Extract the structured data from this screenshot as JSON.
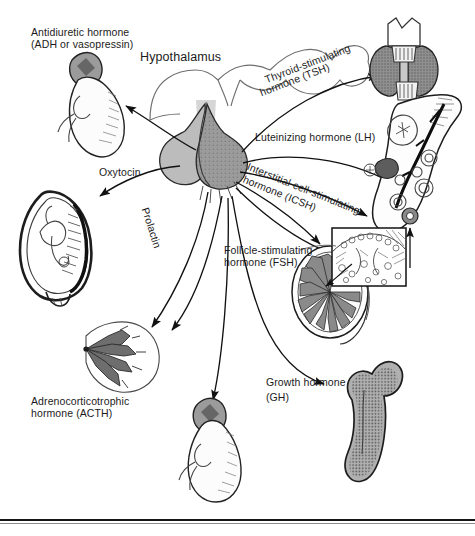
{
  "figure": {
    "colors": {
      "ink": "#1b1b1b",
      "posterior_lobe": "#b9b9b9",
      "anterior_lobe": "#8d8d8d",
      "organ_fill": "#ffffff",
      "organ_shade": "#9a9a9a",
      "thyroid_fill": "#8f8f8f",
      "background": "#ffffff"
    }
  },
  "labels": {
    "hypothalamus": "Hypothalamus",
    "adh": "Antidiuretic hormone\n(ADH or vasopressin)",
    "adh_line1": "Antidiuretic hormone",
    "adh_line2": "(ADH or vasopressin)",
    "oxytocin": "Oxytocin",
    "prolactin": "Prolactin",
    "acth_line1": "Adrenocorticotrophic",
    "acth_line2": "hormone (ACTH)",
    "tsh_line1": "Thyroid-stimulating",
    "tsh_line2": "hormone (TSH)",
    "lh": "Luteinizing hormone (LH)",
    "icsh_line1": "Interstitial-cell-stimulating",
    "icsh_line2": "hormone (ICSH)",
    "fsh_line1": "Follicle-stimulating",
    "fsh_line2": "hormone (FSH)",
    "gh_line1": "Growth hormone",
    "gh_line2": "(GH)"
  },
  "organs": [
    {
      "name": "kidney-adrenal-gland-top-left",
      "label_ref": "adh"
    },
    {
      "name": "pregnant-uterus-with-fetus",
      "label_ref": "oxytocin"
    },
    {
      "name": "mammary-gland",
      "label_ref": "prolactin"
    },
    {
      "name": "kidney-adrenal-gland-bottom",
      "label_ref": "acth"
    },
    {
      "name": "thyroid-gland-with-larynx",
      "label_ref": "tsh"
    },
    {
      "name": "ovary-with-follicles",
      "label_ref": "lh"
    },
    {
      "name": "testis-cross-section-with-inset",
      "label_ref": "fsh"
    },
    {
      "name": "femur-bone",
      "label_ref": "gh"
    },
    {
      "name": "pituitary-gland",
      "label_ref": "hypothalamus"
    }
  ],
  "arrows": [
    {
      "name": "arrow-adh-to-adrenal",
      "from": "pituitary-posterior",
      "to": "kidney-adrenal-gland-top-left"
    },
    {
      "name": "arrow-oxytocin-to-uterus",
      "from": "pituitary-posterior",
      "to": "pregnant-uterus-with-fetus"
    },
    {
      "name": "arrow-prolactin-to-breast",
      "from": "pituitary-anterior",
      "to": "mammary-gland"
    },
    {
      "name": "arrow-unlabeled-to-breast",
      "from": "pituitary-anterior",
      "to": "mammary-gland"
    },
    {
      "name": "arrow-acth-to-adrenal",
      "from": "pituitary-anterior",
      "to": "kidney-adrenal-gland-bottom"
    },
    {
      "name": "arrow-tsh-to-thyroid",
      "from": "pituitary-anterior",
      "to": "thyroid-gland-with-larynx"
    },
    {
      "name": "arrow-lh-to-ovary",
      "from": "pituitary-anterior",
      "to": "ovary-with-follicles"
    },
    {
      "name": "arrow-icsh-to-testis",
      "from": "pituitary-anterior",
      "to": "testis-cross-section-with-inset"
    },
    {
      "name": "arrow-fsh-to-testis",
      "from": "pituitary-anterior",
      "to": "testis-cross-section-with-inset"
    },
    {
      "name": "arrow-fsh-to-ovary",
      "from": "pituitary-anterior",
      "to": "ovary-with-follicles"
    },
    {
      "name": "arrow-gh-to-bone",
      "from": "pituitary-anterior",
      "to": "femur-bone"
    }
  ]
}
